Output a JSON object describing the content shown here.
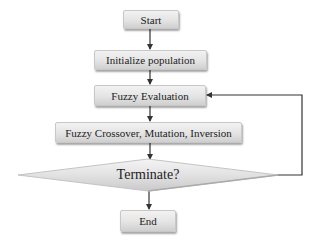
{
  "flowchart": {
    "nodes": [
      {
        "id": "start",
        "type": "terminal",
        "label": "Start"
      },
      {
        "id": "init",
        "type": "process",
        "label": "Initialize population"
      },
      {
        "id": "eval",
        "type": "process",
        "label": "Fuzzy Evaluation"
      },
      {
        "id": "ops",
        "type": "process",
        "label": "Fuzzy Crossover, Mutation, Inversion"
      },
      {
        "id": "decision",
        "type": "decision",
        "label": "Terminate?"
      },
      {
        "id": "end",
        "type": "terminal",
        "label": "End"
      }
    ],
    "edges": [
      {
        "from": "start",
        "to": "init"
      },
      {
        "from": "init",
        "to": "eval"
      },
      {
        "from": "eval",
        "to": "ops"
      },
      {
        "from": "ops",
        "to": "decision"
      },
      {
        "from": "decision",
        "to": "end"
      },
      {
        "from": "decision",
        "to": "eval",
        "route": "loop-right"
      }
    ]
  },
  "colors": {
    "box_fill_top": "#f2f2f2",
    "box_fill_bottom": "#cfcfcf",
    "line": "#333333",
    "text": "#222222"
  }
}
